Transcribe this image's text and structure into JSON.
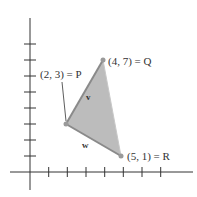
{
  "figure": {
    "type": "vector-triangle-diagram",
    "axes": {
      "x_ticks": [
        1,
        2,
        3,
        4,
        5,
        6,
        7
      ],
      "y_ticks": [
        1,
        2,
        3,
        4,
        5,
        6,
        7,
        8
      ]
    },
    "points": [
      {
        "name": "P",
        "coords": [
          2,
          3
        ],
        "label": "(2, 3) = P"
      },
      {
        "name": "Q",
        "coords": [
          4,
          7
        ],
        "label": "(4, 7) = Q"
      },
      {
        "name": "R",
        "coords": [
          5,
          1
        ],
        "label": "(5, 1) = R"
      }
    ],
    "vectors": [
      {
        "name": "v",
        "from": "P",
        "to": "Q",
        "label": "v"
      },
      {
        "name": "w",
        "from": "P",
        "to": "R",
        "label": "w"
      }
    ],
    "colors": {
      "fill": "#b9b9b9",
      "edge": "#8a8a8a",
      "point": "#9a9a9a",
      "axis": "#333333"
    }
  }
}
